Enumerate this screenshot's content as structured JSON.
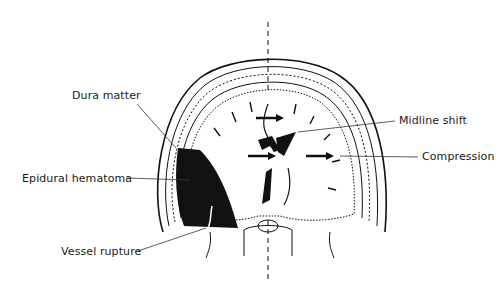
{
  "diagram": {
    "labels": {
      "dura_matter": "Dura matter",
      "epidural_hematoma": "Epidural hematoma",
      "vessel_rupture": "Vessel rupture",
      "midline_shift": "Midline shift",
      "compression": "Compression"
    },
    "colors": {
      "ink": "#111111",
      "background": "#ffffff",
      "stipple": "#bbbbbb"
    }
  }
}
